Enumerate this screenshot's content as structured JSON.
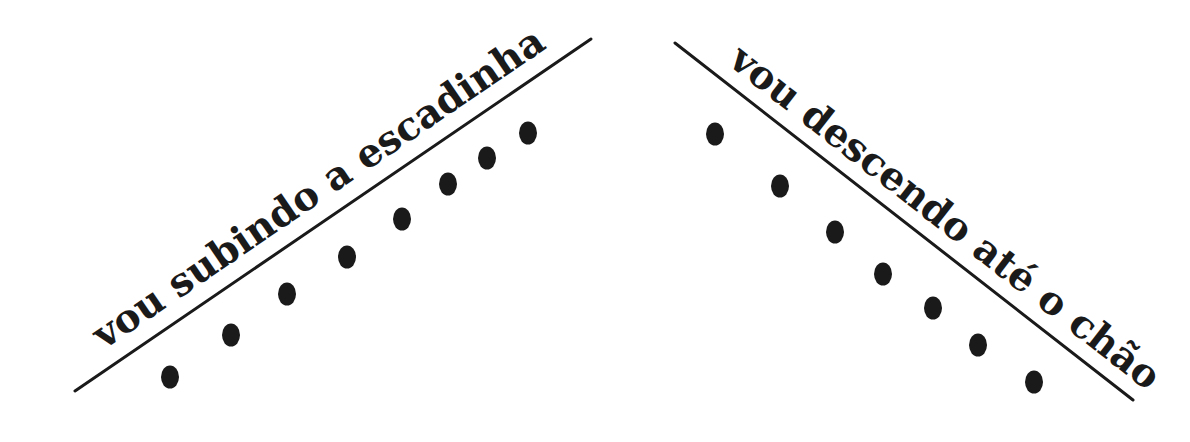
{
  "left": {
    "text": "vou subindo a escadinha",
    "line": {
      "x1": 75,
      "y1": 391,
      "x2": 591,
      "y2": 39
    },
    "dots": [
      [
        170,
        377
      ],
      [
        231,
        335
      ],
      [
        287,
        294
      ],
      [
        347,
        257
      ],
      [
        402,
        219
      ],
      [
        448,
        184
      ],
      [
        487,
        158
      ],
      [
        528,
        133
      ]
    ]
  },
  "right": {
    "text": "vou descendo até o chão",
    "line": {
      "x1": 675,
      "y1": 43,
      "x2": 1133,
      "y2": 400
    },
    "dots": [
      [
        715,
        134
      ],
      [
        780,
        186
      ],
      [
        835,
        232
      ],
      [
        883,
        274
      ],
      [
        933,
        308
      ],
      [
        978,
        345
      ],
      [
        1034,
        382
      ]
    ]
  },
  "colors": {
    "ink": "#1a1a1a",
    "background": "#ffffff"
  }
}
